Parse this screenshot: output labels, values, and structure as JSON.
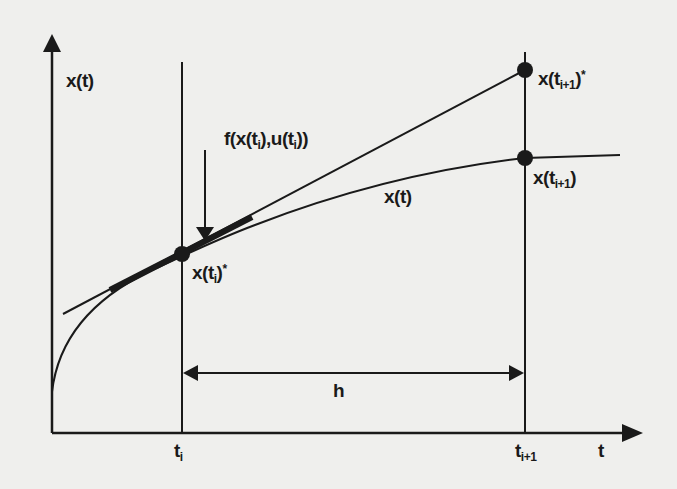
{
  "figure": {
    "type": "explicit-euler-step-illustration",
    "colors": {
      "background": "#efefed",
      "ink": "#1a1a1a"
    },
    "axes": {
      "y_label": "x(t)",
      "x_label": "t",
      "x_ticks": [
        {
          "base": "t",
          "sub": "i"
        },
        {
          "base": "t",
          "sub": "i+1"
        }
      ]
    },
    "labels": {
      "slope": {
        "pre": "f(x(t",
        "sub1": "i",
        "mid": "),u(t",
        "sub2": "i",
        "post": "))"
      },
      "point_ti_star": {
        "pre": "x(t",
        "sub": "i",
        "post": ")",
        "sup": "*"
      },
      "point_ti1_star": {
        "pre": "x(t",
        "sub": "i+1",
        "post": ")",
        "sup": "*"
      },
      "point_ti1": {
        "pre": "x(t",
        "sub": "i+1",
        "post": ")"
      },
      "curve": "x(t)",
      "step": "h"
    },
    "points": [
      {
        "name": "x(t_i)*",
        "x": 182,
        "y": 254
      },
      {
        "name": "x(t_i+1)*",
        "x": 525,
        "y": 70
      },
      {
        "name": "x(t_i+1)",
        "x": 525,
        "y": 158
      }
    ]
  }
}
